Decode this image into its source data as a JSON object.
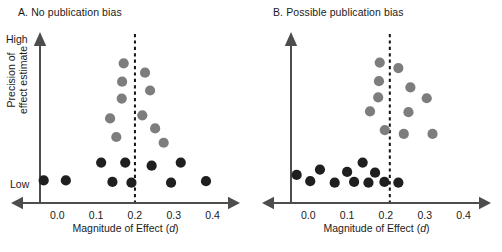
{
  "figure": {
    "axis_color": "#4d4d4d",
    "dark_point_color": "#1f1f1f",
    "gray_point_color": "#7d7d7d",
    "reference_line_color": "#111111"
  },
  "panels": [
    {
      "id": "A",
      "title": "A. No publication bias",
      "y_axis_top_label": "High",
      "y_axis_bottom_label": "Low",
      "y_axis_title_line1": "Precision of",
      "y_axis_title_line2": "effect estimate",
      "x_axis_title": "Magnitude of Effect (",
      "x_axis_title_italic": "d",
      "x_axis_title_end": ")",
      "x_ticks": [
        "0.0",
        "0.1",
        "0.2",
        "0.3",
        "0.4"
      ]
    },
    {
      "id": "B",
      "title": "B. Possible publication bias",
      "x_axis_title": "Magnitude of Effect (",
      "x_axis_title_italic": "d",
      "x_axis_title_end": ")",
      "x_ticks": [
        "0.0",
        "0.1",
        "0.2",
        "0.3",
        "0.4"
      ]
    }
  ],
  "chart_data": [
    {
      "type": "scatter",
      "title": "A. No publication bias",
      "xlabel": "Magnitude of Effect (d)",
      "ylabel": "Precision of effect estimate",
      "xlim": [
        -0.06,
        0.45
      ],
      "ylim": [
        0,
        1
      ],
      "xticks": [
        0.0,
        0.1,
        0.2,
        0.3,
        0.4
      ],
      "ytick_labels": [
        "Low",
        "High"
      ],
      "grid": false,
      "legend": "none",
      "reference_line": {
        "orientation": "vertical",
        "x": 0.2,
        "style": "dashed",
        "label": ""
      },
      "series": [
        {
          "name": "High precision studies",
          "color": "#7d7d7d",
          "points": [
            {
              "x": 0.171,
              "y": 0.875
            },
            {
              "x": 0.226,
              "y": 0.815
            },
            {
              "x": 0.167,
              "y": 0.757
            },
            {
              "x": 0.239,
              "y": 0.7
            },
            {
              "x": 0.166,
              "y": 0.648
            },
            {
              "x": 0.219,
              "y": 0.54
            },
            {
              "x": 0.136,
              "y": 0.52
            },
            {
              "x": 0.252,
              "y": 0.455
            },
            {
              "x": 0.152,
              "y": 0.4
            },
            {
              "x": 0.274,
              "y": 0.363
            }
          ]
        },
        {
          "name": "Low precision studies",
          "color": "#1f1f1f",
          "points": [
            {
              "x": 0.113,
              "y": 0.235
            },
            {
              "x": 0.175,
              "y": 0.235
            },
            {
              "x": 0.243,
              "y": 0.215
            },
            {
              "x": 0.318,
              "y": 0.235
            },
            {
              "x": -0.035,
              "y": 0.12
            },
            {
              "x": 0.022,
              "y": 0.12
            },
            {
              "x": 0.142,
              "y": 0.11
            },
            {
              "x": 0.191,
              "y": 0.105
            },
            {
              "x": 0.293,
              "y": 0.105
            },
            {
              "x": 0.383,
              "y": 0.115
            }
          ]
        }
      ]
    },
    {
      "type": "scatter",
      "title": "B. Possible publication bias",
      "xlabel": "Magnitude of Effect (d)",
      "ylabel": "Precision of effect estimate",
      "xlim": [
        -0.06,
        0.45
      ],
      "ylim": [
        0,
        1
      ],
      "xticks": [
        0.0,
        0.1,
        0.2,
        0.3,
        0.4
      ],
      "grid": false,
      "legend": "none",
      "reference_line": {
        "orientation": "vertical",
        "x": 0.21,
        "style": "dashed",
        "label": ""
      },
      "series": [
        {
          "name": "High precision studies",
          "color": "#7d7d7d",
          "points": [
            {
              "x": 0.184,
              "y": 0.88
            },
            {
              "x": 0.232,
              "y": 0.845
            },
            {
              "x": 0.182,
              "y": 0.76
            },
            {
              "x": 0.263,
              "y": 0.72
            },
            {
              "x": 0.18,
              "y": 0.655
            },
            {
              "x": 0.305,
              "y": 0.65
            },
            {
              "x": 0.159,
              "y": 0.565
            },
            {
              "x": 0.258,
              "y": 0.56
            },
            {
              "x": 0.197,
              "y": 0.445
            },
            {
              "x": 0.246,
              "y": 0.42
            },
            {
              "x": 0.32,
              "y": 0.42
            }
          ]
        },
        {
          "name": "Low precision studies",
          "color": "#1f1f1f",
          "points": [
            {
              "x": 0.14,
              "y": 0.235
            },
            {
              "x": 0.03,
              "y": 0.19
            },
            {
              "x": 0.1,
              "y": 0.175
            },
            {
              "x": 0.172,
              "y": 0.17
            },
            {
              "x": -0.03,
              "y": 0.155
            },
            {
              "x": 0.005,
              "y": 0.115
            },
            {
              "x": 0.068,
              "y": 0.105
            },
            {
              "x": 0.118,
              "y": 0.11
            },
            {
              "x": 0.155,
              "y": 0.105
            },
            {
              "x": 0.196,
              "y": 0.11
            },
            {
              "x": 0.232,
              "y": 0.105
            }
          ]
        }
      ]
    }
  ]
}
